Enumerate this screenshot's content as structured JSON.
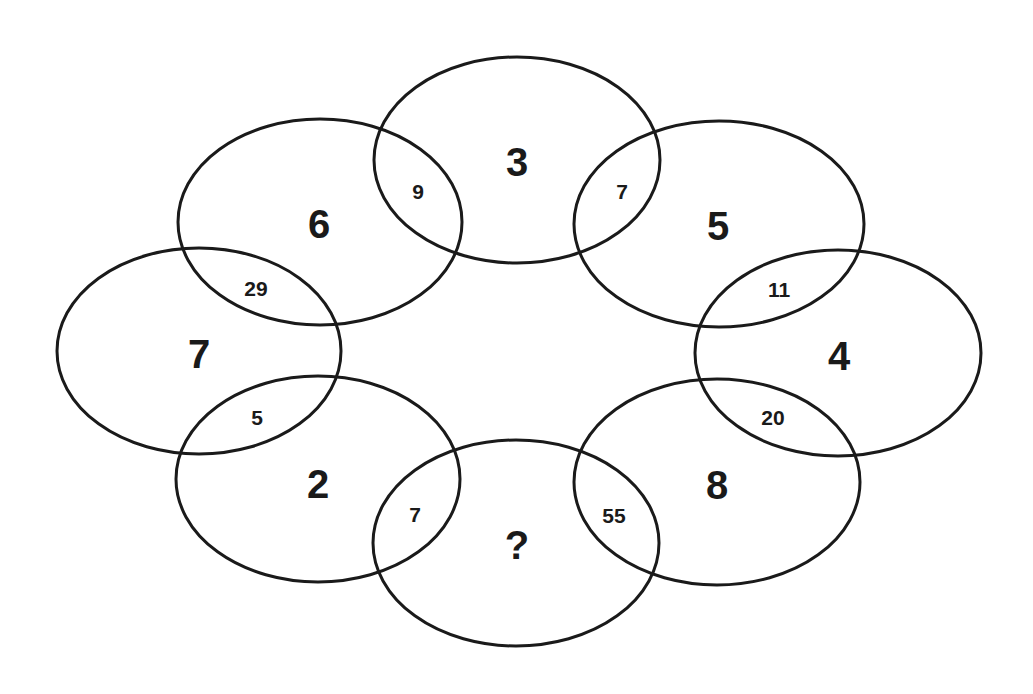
{
  "puzzle": {
    "circles": [
      {
        "id": "top",
        "value": "3"
      },
      {
        "id": "top-right",
        "value": "5"
      },
      {
        "id": "right",
        "value": "4"
      },
      {
        "id": "bottom-right",
        "value": "8"
      },
      {
        "id": "bottom",
        "value": "?"
      },
      {
        "id": "bottom-left",
        "value": "2"
      },
      {
        "id": "left",
        "value": "7"
      },
      {
        "id": "top-left",
        "value": "6"
      }
    ],
    "overlaps": [
      {
        "between": "top-left/top",
        "value": "9"
      },
      {
        "between": "top/top-right",
        "value": "7"
      },
      {
        "between": "top-right/right",
        "value": "11"
      },
      {
        "between": "right/bottom-right",
        "value": "20"
      },
      {
        "between": "bottom-right/bottom",
        "value": "55"
      },
      {
        "between": "bottom/bottom-left",
        "value": "7"
      },
      {
        "between": "bottom-left/left",
        "value": "5"
      },
      {
        "between": "left/top-left",
        "value": "29"
      }
    ]
  }
}
